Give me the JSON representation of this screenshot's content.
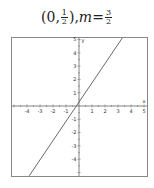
{
  "title": {
    "point_open": "(0, ",
    "point_num": "1",
    "point_den": "2",
    "point_close": "), ",
    "m_label": "m",
    "equals": " = ",
    "m_num": "3",
    "m_den": "2"
  },
  "chart_data": {
    "type": "line",
    "xlabel": "x",
    "ylabel": "y",
    "xlim": [
      -5,
      5
    ],
    "ylim": [
      -5,
      5
    ],
    "xticks": [
      -5,
      -4,
      -3,
      -2,
      -1,
      1,
      2,
      3,
      4,
      5
    ],
    "yticks": [
      -5,
      -4,
      -3,
      -2,
      -1,
      1,
      2,
      3,
      4,
      5
    ],
    "xtick_labels": [
      "-4",
      "-3",
      "-2",
      "-1",
      "1",
      "2",
      "3",
      "4",
      "5"
    ],
    "ytick_labels": [
      "5",
      "4",
      "3",
      "2",
      "1",
      "-1",
      "-2",
      "-3",
      "-4"
    ],
    "grid": false,
    "series": [
      {
        "name": "y = 3/2 x + 1/2",
        "slope": 1.5,
        "intercept": 0.5,
        "x": [
          -3.83,
          3.33
        ],
        "y": [
          -5.25,
          5.5
        ],
        "color": "#444444"
      }
    ],
    "point": {
      "x": 0,
      "y": 0.5
    }
  }
}
